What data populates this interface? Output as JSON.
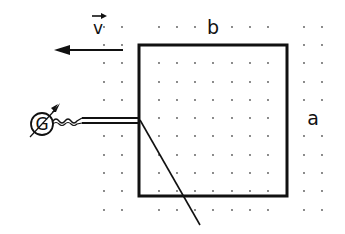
{
  "diagram": {
    "labels": {
      "velocity": "v",
      "width": "b",
      "height": "a",
      "galvanometer": "G"
    },
    "colors": {
      "ink": "#111111",
      "dots": "#555555",
      "background": "#ffffff"
    },
    "field": {
      "symbol": "dot",
      "direction": "out-of-page",
      "grid_x": [
        104,
        122,
        140,
        159,
        177,
        195,
        213,
        232,
        250,
        268,
        286,
        304,
        322
      ],
      "grid_y": [
        27,
        45,
        63,
        82,
        100,
        118,
        136,
        155,
        173,
        191,
        210
      ]
    },
    "loop": {
      "x": 139,
      "y": 45,
      "width": 148,
      "height": 151
    },
    "velocity_arrow": {
      "x1": 123,
      "y1": 50,
      "x2": 65,
      "y2": 50
    },
    "rod": {
      "x1": 140,
      "y1": 120,
      "x2": 200,
      "y2": 225
    },
    "galvanometer": {
      "cx": 42,
      "cy": 124,
      "r": 11
    }
  }
}
